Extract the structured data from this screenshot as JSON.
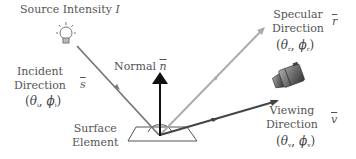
{
  "source": {
    "label": "Source Intensity",
    "symbol": "I"
  },
  "normal": {
    "label": "Normal",
    "symbol": "n"
  },
  "incident": {
    "line1": "Incident",
    "line2": "Direction",
    "vector": "s",
    "theta": "θ",
    "phi": "ϕ",
    "subscript": "i"
  },
  "specular": {
    "line1": "Specular",
    "line2": "Direction",
    "vector": "r",
    "theta": "θ",
    "phi": "ϕ",
    "subscript": "r"
  },
  "viewing": {
    "line1": "Viewing",
    "line2": "Direction",
    "vector": "v",
    "theta": "θ",
    "phi": "ϕ",
    "subscript": "v"
  },
  "surface": {
    "line1": "Surface",
    "line2": "Element"
  },
  "colors": {
    "incident": "#777777",
    "specular": "#aaaaaa",
    "normal": "#111111",
    "viewing": "#444444",
    "text": "#555555"
  }
}
